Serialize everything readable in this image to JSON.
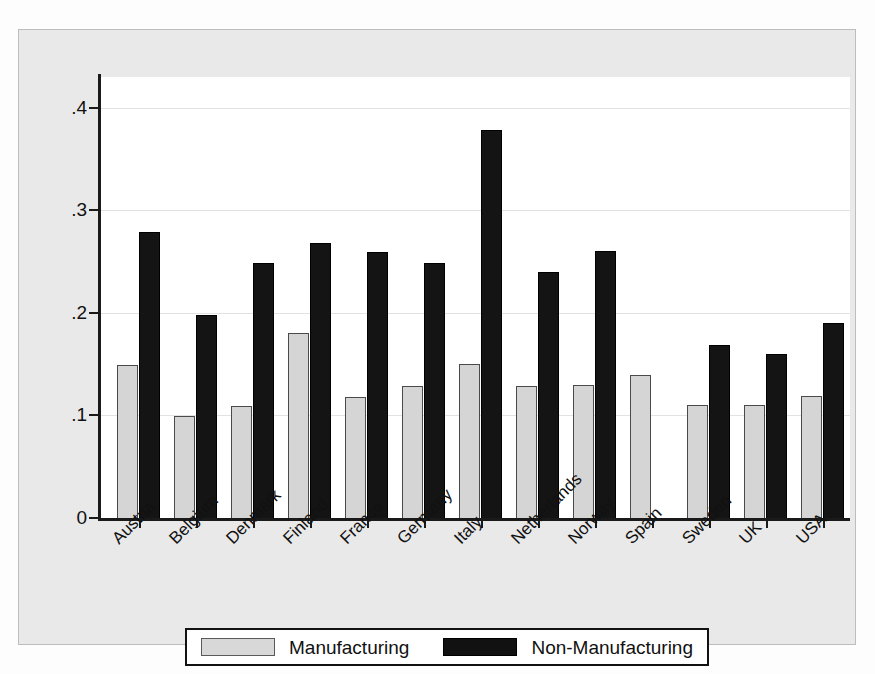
{
  "chart_data": {
    "type": "bar",
    "title": "",
    "xlabel": "",
    "ylabel": "",
    "ylim": [
      0,
      0.43
    ],
    "yticks": [
      0,
      0.1,
      0.2,
      0.3,
      0.4
    ],
    "ytick_labels": [
      "0",
      ".1",
      ".2",
      ".3",
      ".4"
    ],
    "grid": true,
    "legend_position": "bottom-center",
    "categories": [
      "Austria",
      "Belgium",
      "Denmark",
      "Finland",
      "France",
      "Germany",
      "Italy",
      "Netherlands",
      "Norway",
      "Spain",
      "Sweden",
      "UK",
      "USA"
    ],
    "series": [
      {
        "name": "Manufacturing",
        "color": "#d5d5d5",
        "values": [
          0.151,
          0.101,
          0.111,
          0.182,
          0.12,
          0.131,
          0.152,
          0.131,
          0.132,
          0.141,
          0.112,
          0.112,
          0.121
        ]
      },
      {
        "name": "Non-Manufacturing",
        "color": "#141414",
        "values": [
          0.281,
          0.2,
          0.251,
          0.27,
          0.261,
          0.251,
          0.38,
          0.242,
          0.262,
          null,
          0.171,
          0.162,
          0.192
        ]
      }
    ]
  },
  "legend": {
    "items": [
      {
        "label": "Manufacturing",
        "swatch": "manu"
      },
      {
        "label": "Non-Manufacturing",
        "swatch": "nonmanu"
      }
    ]
  }
}
